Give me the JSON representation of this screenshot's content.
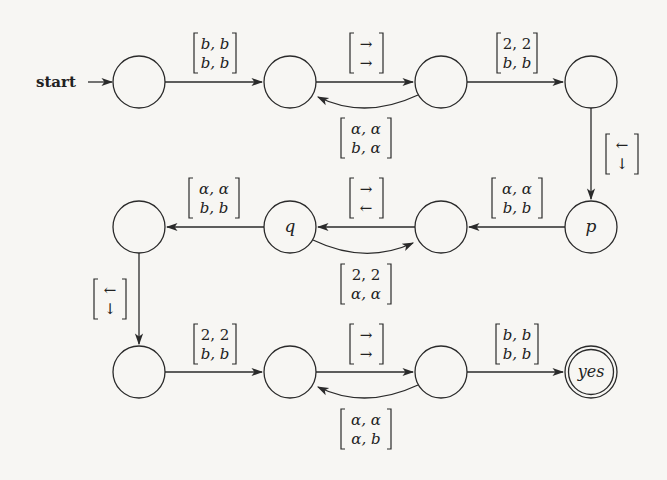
{
  "diagram": {
    "start_label": "start",
    "nodes": [
      {
        "id": "r1c1",
        "label": "",
        "x": 139,
        "y": 82
      },
      {
        "id": "r1c2",
        "label": "",
        "x": 290,
        "y": 82
      },
      {
        "id": "r1c3",
        "label": "",
        "x": 441,
        "y": 82
      },
      {
        "id": "r1c4",
        "label": "",
        "x": 591,
        "y": 82
      },
      {
        "id": "p",
        "label": "p",
        "x": 591,
        "y": 227
      },
      {
        "id": "r2c3",
        "label": "",
        "x": 441,
        "y": 227
      },
      {
        "id": "q",
        "label": "q",
        "x": 290,
        "y": 227
      },
      {
        "id": "r2c1",
        "label": "",
        "x": 139,
        "y": 227
      },
      {
        "id": "r3c1",
        "label": "",
        "x": 139,
        "y": 372
      },
      {
        "id": "r3c2",
        "label": "",
        "x": 290,
        "y": 372
      },
      {
        "id": "r3c3",
        "label": "",
        "x": 441,
        "y": 372
      },
      {
        "id": "yes",
        "label": "yes",
        "x": 591,
        "y": 372,
        "accepting": true
      }
    ],
    "edges": [
      {
        "from": "r1c1",
        "to": "r1c2",
        "top": "b, b",
        "bottom": "b, b"
      },
      {
        "from": "r1c2",
        "to": "r1c3",
        "top": "→",
        "bottom": "→"
      },
      {
        "from": "r1c3",
        "to": "r1c2",
        "top": "α, α",
        "bottom": "b, α",
        "curved": true
      },
      {
        "from": "r1c3",
        "to": "r1c4",
        "top": "2, 2",
        "bottom": "b, b"
      },
      {
        "from": "r1c4",
        "to": "p",
        "top": "←",
        "bottom": "↓"
      },
      {
        "from": "p",
        "to": "r2c3",
        "top": "α, α",
        "bottom": "b, b"
      },
      {
        "from": "r2c3",
        "to": "q",
        "top": "→",
        "bottom": "←"
      },
      {
        "from": "q",
        "to": "r2c3",
        "top": "2, 2",
        "bottom": "α, α",
        "curved": true
      },
      {
        "from": "q",
        "to": "r2c1",
        "top": "α, α",
        "bottom": "b, b"
      },
      {
        "from": "r2c1",
        "to": "r3c1",
        "top": "←",
        "bottom": "↓"
      },
      {
        "from": "r3c1",
        "to": "r3c2",
        "top": "2, 2",
        "bottom": "b, b"
      },
      {
        "from": "r3c2",
        "to": "r3c3",
        "top": "→",
        "bottom": "→"
      },
      {
        "from": "r3c3",
        "to": "r3c2",
        "top": "α, α",
        "bottom": "α, b",
        "curved": true
      },
      {
        "from": "r3c3",
        "to": "yes",
        "top": "b, b",
        "bottom": "b, b"
      }
    ]
  }
}
